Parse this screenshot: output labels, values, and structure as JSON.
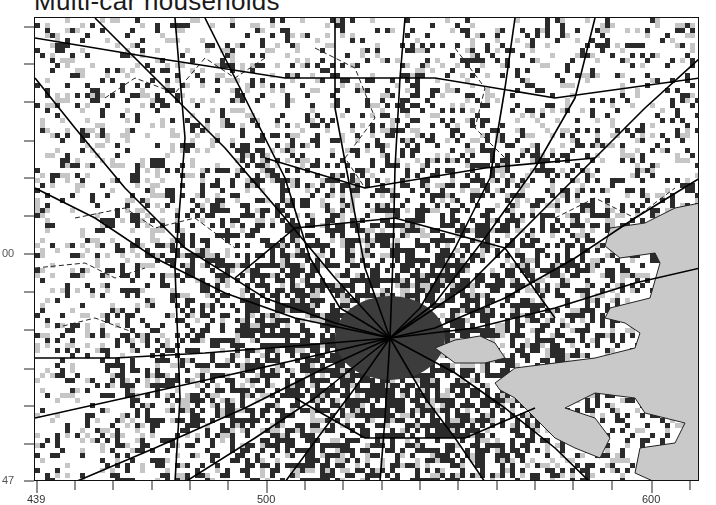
{
  "title": "Multi-car households",
  "colors": {
    "high": "#2b2b2b",
    "medium": "#c6c6c6",
    "low": "#ffffff",
    "core": "#3c3c3c",
    "water": "#c9c9c9",
    "road": "#000000",
    "boundary": "#222222",
    "frame": "#111111"
  },
  "map": {
    "frame": {
      "x": 34,
      "y": 17,
      "w": 665,
      "h": 464
    },
    "cell_size": 5,
    "density_center": {
      "x": 355,
      "y": 330
    },
    "core": {
      "cx": 355,
      "cy": 320,
      "rx": 55,
      "ry": 42
    },
    "water": [
      [
        [
          575,
          210
        ],
        [
          610,
          205
        ],
        [
          640,
          190
        ],
        [
          665,
          185
        ],
        [
          665,
          464
        ],
        [
          620,
          464
        ],
        [
          600,
          455
        ],
        [
          605,
          430
        ],
        [
          640,
          425
        ],
        [
          650,
          405
        ],
        [
          610,
          395
        ],
        [
          600,
          380
        ],
        [
          560,
          375
        ],
        [
          540,
          385
        ],
        [
          530,
          390
        ],
        [
          560,
          400
        ],
        [
          575,
          420
        ],
        [
          565,
          440
        ],
        [
          540,
          430
        ],
        [
          520,
          420
        ],
        [
          500,
          400
        ],
        [
          480,
          380
        ],
        [
          465,
          372
        ],
        [
          460,
          365
        ],
        [
          480,
          350
        ],
        [
          520,
          345
        ],
        [
          560,
          340
        ],
        [
          600,
          330
        ],
        [
          605,
          315
        ],
        [
          590,
          305
        ],
        [
          570,
          300
        ],
        [
          575,
          290
        ],
        [
          615,
          280
        ],
        [
          625,
          245
        ],
        [
          620,
          235
        ],
        [
          585,
          240
        ],
        [
          570,
          228
        ]
      ],
      [
        [
          400,
          330
        ],
        [
          420,
          322
        ],
        [
          445,
          318
        ],
        [
          460,
          325
        ],
        [
          470,
          340
        ],
        [
          450,
          345
        ],
        [
          420,
          345
        ]
      ]
    ],
    "roads": [
      [
        [
          0,
          60
        ],
        [
          40,
          110
        ],
        [
          90,
          170
        ],
        [
          150,
          230
        ],
        [
          230,
          280
        ],
        [
          300,
          305
        ],
        [
          355,
          320
        ]
      ],
      [
        [
          0,
          170
        ],
        [
          60,
          200
        ],
        [
          120,
          240
        ],
        [
          190,
          275
        ],
        [
          260,
          300
        ],
        [
          355,
          320
        ]
      ],
      [
        [
          60,
          0
        ],
        [
          120,
          60
        ],
        [
          190,
          130
        ],
        [
          250,
          200
        ],
        [
          300,
          260
        ],
        [
          355,
          320
        ]
      ],
      [
        [
          170,
          0
        ],
        [
          215,
          90
        ],
        [
          250,
          160
        ],
        [
          275,
          240
        ],
        [
          305,
          290
        ],
        [
          355,
          320
        ]
      ],
      [
        [
          300,
          0
        ],
        [
          300,
          90
        ],
        [
          315,
          170
        ],
        [
          330,
          250
        ],
        [
          355,
          320
        ]
      ],
      [
        [
          370,
          0
        ],
        [
          365,
          60
        ],
        [
          360,
          150
        ],
        [
          358,
          240
        ],
        [
          355,
          320
        ]
      ],
      [
        [
          480,
          0
        ],
        [
          470,
          70
        ],
        [
          455,
          160
        ],
        [
          420,
          230
        ],
        [
          385,
          290
        ],
        [
          355,
          320
        ]
      ],
      [
        [
          560,
          0
        ],
        [
          540,
          80
        ],
        [
          500,
          150
        ],
        [
          450,
          220
        ],
        [
          400,
          285
        ],
        [
          355,
          320
        ]
      ],
      [
        [
          665,
          40
        ],
        [
          610,
          90
        ],
        [
          560,
          140
        ],
        [
          500,
          200
        ],
        [
          430,
          270
        ],
        [
          355,
          320
        ]
      ],
      [
        [
          665,
          160
        ],
        [
          600,
          200
        ],
        [
          540,
          240
        ],
        [
          470,
          280
        ],
        [
          400,
          310
        ],
        [
          355,
          320
        ]
      ],
      [
        [
          665,
          250
        ],
        [
          600,
          265
        ],
        [
          520,
          290
        ],
        [
          440,
          310
        ],
        [
          355,
          320
        ]
      ],
      [
        [
          555,
          464
        ],
        [
          520,
          430
        ],
        [
          470,
          390
        ],
        [
          420,
          355
        ],
        [
          355,
          320
        ]
      ],
      [
        [
          450,
          464
        ],
        [
          420,
          420
        ],
        [
          390,
          380
        ],
        [
          355,
          320
        ]
      ],
      [
        [
          345,
          464
        ],
        [
          350,
          400
        ],
        [
          355,
          320
        ]
      ],
      [
        [
          250,
          464
        ],
        [
          290,
          410
        ],
        [
          320,
          370
        ],
        [
          355,
          320
        ]
      ],
      [
        [
          150,
          464
        ],
        [
          220,
          420
        ],
        [
          280,
          380
        ],
        [
          355,
          320
        ]
      ],
      [
        [
          40,
          464
        ],
        [
          120,
          430
        ],
        [
          210,
          390
        ],
        [
          290,
          350
        ],
        [
          355,
          320
        ]
      ],
      [
        [
          0,
          340
        ],
        [
          80,
          340
        ],
        [
          170,
          335
        ],
        [
          260,
          328
        ],
        [
          355,
          320
        ]
      ],
      [
        [
          0,
          400
        ],
        [
          90,
          380
        ],
        [
          180,
          360
        ],
        [
          270,
          340
        ],
        [
          355,
          320
        ]
      ],
      [
        [
          140,
          0
        ],
        [
          150,
          120
        ],
        [
          140,
          250
        ],
        [
          145,
          380
        ],
        [
          140,
          464
        ]
      ],
      [
        [
          0,
          20
        ],
        [
          120,
          40
        ],
        [
          250,
          60
        ],
        [
          400,
          60
        ],
        [
          520,
          80
        ],
        [
          665,
          60
        ]
      ],
      [
        [
          230,
          140
        ],
        [
          330,
          170
        ],
        [
          450,
          150
        ],
        [
          560,
          140
        ]
      ],
      [
        [
          200,
          260
        ],
        [
          260,
          210
        ],
        [
          360,
          200
        ],
        [
          470,
          230
        ],
        [
          520,
          300
        ]
      ],
      [
        [
          260,
          380
        ],
        [
          330,
          420
        ],
        [
          430,
          420
        ],
        [
          500,
          390
        ]
      ]
    ],
    "boundaries": [
      [
        [
          70,
          80
        ],
        [
          100,
          60
        ],
        [
          140,
          75
        ],
        [
          170,
          40
        ],
        [
          200,
          60
        ],
        [
          230,
          40
        ]
      ],
      [
        [
          40,
          200
        ],
        [
          90,
          190
        ],
        [
          120,
          210
        ],
        [
          160,
          200
        ],
        [
          200,
          230
        ]
      ],
      [
        [
          280,
          30
        ],
        [
          320,
          50
        ],
        [
          340,
          100
        ],
        [
          310,
          140
        ],
        [
          330,
          170
        ]
      ],
      [
        [
          420,
          30
        ],
        [
          450,
          70
        ],
        [
          440,
          110
        ],
        [
          470,
          140
        ]
      ],
      [
        [
          520,
          200
        ],
        [
          560,
          180
        ],
        [
          600,
          200
        ],
        [
          640,
          170
        ]
      ],
      [
        [
          0,
          250
        ],
        [
          50,
          245
        ],
        [
          80,
          260
        ],
        [
          110,
          250
        ]
      ],
      [
        [
          20,
          310
        ],
        [
          60,
          300
        ],
        [
          100,
          315
        ]
      ]
    ]
  },
  "axes": {
    "x": {
      "ticks": [
        {
          "x": 37,
          "label": "439"
        },
        {
          "x": 75,
          "label": ""
        },
        {
          "x": 113,
          "label": ""
        },
        {
          "x": 152,
          "label": ""
        },
        {
          "x": 190,
          "label": ""
        },
        {
          "x": 228,
          "label": ""
        },
        {
          "x": 267,
          "label": "500"
        },
        {
          "x": 305,
          "label": ""
        },
        {
          "x": 343,
          "label": ""
        },
        {
          "x": 382,
          "label": ""
        },
        {
          "x": 420,
          "label": ""
        },
        {
          "x": 458,
          "label": ""
        },
        {
          "x": 497,
          "label": ""
        },
        {
          "x": 535,
          "label": ""
        },
        {
          "x": 573,
          "label": ""
        },
        {
          "x": 612,
          "label": ""
        },
        {
          "x": 652,
          "label": "600"
        },
        {
          "x": 690,
          "label": ""
        }
      ]
    },
    "y": {
      "ticks": [
        {
          "y": 27,
          "label": ""
        },
        {
          "y": 64,
          "label": ""
        },
        {
          "y": 102,
          "label": ""
        },
        {
          "y": 141,
          "label": ""
        },
        {
          "y": 178,
          "label": ""
        },
        {
          "y": 216,
          "label": ""
        },
        {
          "y": 254,
          "label": "00"
        },
        {
          "y": 292,
          "label": ""
        },
        {
          "y": 330,
          "label": ""
        },
        {
          "y": 369,
          "label": ""
        },
        {
          "y": 406,
          "label": ""
        },
        {
          "y": 444,
          "label": ""
        },
        {
          "y": 481,
          "label": "47"
        }
      ]
    }
  }
}
